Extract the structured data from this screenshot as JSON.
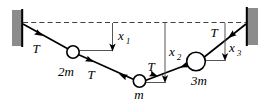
{
  "figure": {
    "kind": "physics-free-body-diagram",
    "title": "",
    "background_color": "#ffffff",
    "line_color": "#000000",
    "wall_fill_color": "#8c8c8c",
    "wall_edge_color": "#000000",
    "mass_fill_color": "#ffffff",
    "dashed_line_color": "#404040",
    "leader_line_color": "#555555"
  },
  "walls": [
    {
      "name": "left-wall",
      "label": ""
    },
    {
      "name": "right-wall",
      "label": ""
    }
  ],
  "reference_line": {
    "name": "dashed-reference-line",
    "style": "dashed",
    "label": ""
  },
  "masses": [
    {
      "id": "mass-2m",
      "label": "2m",
      "size": "small"
    },
    {
      "id": "mass-m",
      "label": "m",
      "size": "small"
    },
    {
      "id": "mass-3m",
      "label": "3m",
      "size": "large"
    }
  ],
  "tensions": [
    {
      "id": "tension-left-wall-to-2m",
      "label": "T"
    },
    {
      "id": "tension-2m-to-m",
      "label": "T"
    },
    {
      "id": "tension-m-to-3m",
      "label": "T"
    },
    {
      "id": "tension-3m-to-right-wall",
      "label": "T"
    }
  ],
  "displacements": [
    {
      "id": "displacement-x1",
      "base": "x",
      "subscript": "1"
    },
    {
      "id": "displacement-x2",
      "base": "x",
      "subscript": "2"
    },
    {
      "id": "displacement-x3",
      "base": "x",
      "subscript": "3"
    }
  ]
}
